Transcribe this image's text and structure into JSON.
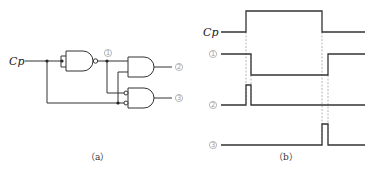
{
  "circuit": {
    "caption": "（a）",
    "input_label": "Cp",
    "node_labels": [
      "1",
      "2",
      "3"
    ],
    "gates": [
      {
        "id": "g1",
        "type": "NAND",
        "inputs": "Cp (tied)",
        "output": "1"
      },
      {
        "id": "g2",
        "type": "AND",
        "inputs": [
          "1",
          "Cp"
        ],
        "output": "2"
      },
      {
        "id": "g3",
        "type": "AND-inverted-inputs",
        "inputs": [
          "1",
          "Cp"
        ],
        "output": "3"
      }
    ]
  },
  "timing": {
    "caption": "（b）",
    "signals": [
      {
        "label": "Cp",
        "description": "low, rises, stays high, falls, low"
      },
      {
        "label": "1",
        "description": "high, falls shortly after Cp rises, rises shortly after Cp falls"
      },
      {
        "label": "2",
        "description": "short positive pulse at Cp rising edge"
      },
      {
        "label": "3",
        "description": "short positive pulse at Cp falling edge"
      }
    ]
  },
  "colors": {
    "line": "#333333",
    "dashed": "#9a9a9a",
    "circled_label": "#999999"
  }
}
